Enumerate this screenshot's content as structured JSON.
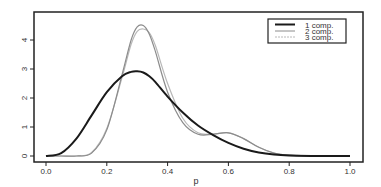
{
  "chart_data": {
    "type": "line",
    "title": "",
    "xlabel": "p",
    "ylabel": "",
    "xlim": [
      0.0,
      1.0
    ],
    "ylim": [
      0,
      4.8
    ],
    "x_ticks": [
      "0.0",
      "0.2",
      "0.4",
      "0.6",
      "0.8",
      "1.0"
    ],
    "y_ticks": [
      "0",
      "1",
      "2",
      "3",
      "4"
    ],
    "grid": false,
    "legend_position": "top-right",
    "x": [
      0.0,
      0.05,
      0.1,
      0.15,
      0.2,
      0.25,
      0.28,
      0.3,
      0.32,
      0.34,
      0.36,
      0.4,
      0.45,
      0.5,
      0.55,
      0.6,
      0.65,
      0.7,
      0.75,
      0.8,
      0.9,
      1.0
    ],
    "series": [
      {
        "name": "1 comp.",
        "color": "#1a1a1a",
        "width": 2,
        "values": [
          0.0,
          0.1,
          0.6,
          1.4,
          2.2,
          2.75,
          2.9,
          2.92,
          2.88,
          2.75,
          2.55,
          2.05,
          1.5,
          1.05,
          0.72,
          0.45,
          0.25,
          0.12,
          0.05,
          0.02,
          0.0,
          0.0
        ]
      },
      {
        "name": "2 comp.",
        "color": "#8c8c8c",
        "width": 1.2,
        "values": [
          0.0,
          0.0,
          0.0,
          0.1,
          0.9,
          2.8,
          4.0,
          4.45,
          4.5,
          4.2,
          3.6,
          2.2,
          1.15,
          0.75,
          0.75,
          0.8,
          0.6,
          0.3,
          0.1,
          0.03,
          0.0,
          0.0
        ]
      },
      {
        "name": "3 comp.",
        "color": "#b8b8b8",
        "width": 1.2,
        "values": [
          0.0,
          0.0,
          0.0,
          0.12,
          0.95,
          2.7,
          3.85,
          4.3,
          4.38,
          4.25,
          3.8,
          2.5,
          1.3,
          0.8,
          0.76,
          0.8,
          0.6,
          0.3,
          0.1,
          0.03,
          0.0,
          0.0
        ]
      }
    ]
  },
  "legend": {
    "items": [
      {
        "label": "1 comp."
      },
      {
        "label": "2 comp."
      },
      {
        "label": "3 comp."
      }
    ]
  },
  "axes": {
    "xlabel": "p"
  }
}
